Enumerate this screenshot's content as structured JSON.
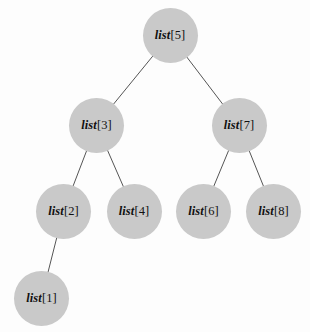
{
  "diagram": {
    "type": "binary-tree",
    "background_color": "#fdfdfd",
    "node_fill_color": "#c9c9c9",
    "edge_color": "#555555",
    "text_color": "#111111",
    "node_radius": 27.5,
    "nodes": [
      {
        "id": "node-5",
        "label": "list[5]",
        "name_part": "list",
        "index_part": "[5]",
        "cx": 170,
        "cy": 35,
        "level": 1,
        "role": "root"
      },
      {
        "id": "node-3",
        "label": "list[3]",
        "name_part": "list",
        "index_part": "[3]",
        "cx": 96.5,
        "cy": 125,
        "level": 2,
        "role": "left-child"
      },
      {
        "id": "node-7",
        "label": "list[7]",
        "name_part": "list",
        "index_part": "[7]",
        "cx": 239,
        "cy": 125.5,
        "level": 2,
        "role": "right-child"
      },
      {
        "id": "node-2",
        "label": "list[2]",
        "name_part": "list",
        "index_part": "[2]",
        "cx": 63.5,
        "cy": 211,
        "level": 3,
        "role": "left-child"
      },
      {
        "id": "node-4",
        "label": "list[4]",
        "name_part": "list",
        "index_part": "[4]",
        "cx": 134,
        "cy": 211,
        "level": 3,
        "role": "right-child"
      },
      {
        "id": "node-6",
        "label": "list[6]",
        "name_part": "list",
        "index_part": "[6]",
        "cx": 203.5,
        "cy": 211,
        "level": 3,
        "role": "left-child"
      },
      {
        "id": "node-8",
        "label": "list[8]",
        "name_part": "list",
        "index_part": "[8]",
        "cx": 273.5,
        "cy": 211,
        "level": 3,
        "role": "right-child"
      },
      {
        "id": "node-1",
        "label": "list[1]",
        "name_part": "list",
        "index_part": "[1]",
        "cx": 41.5,
        "cy": 298,
        "level": 4,
        "role": "left-child"
      }
    ],
    "edges": [
      {
        "id": "edge-5-3",
        "from": "node-5",
        "to": "node-3"
      },
      {
        "id": "edge-5-7",
        "from": "node-5",
        "to": "node-7"
      },
      {
        "id": "edge-3-2",
        "from": "node-3",
        "to": "node-2"
      },
      {
        "id": "edge-3-4",
        "from": "node-3",
        "to": "node-4"
      },
      {
        "id": "edge-7-6",
        "from": "node-7",
        "to": "node-6"
      },
      {
        "id": "edge-7-8",
        "from": "node-7",
        "to": "node-8"
      },
      {
        "id": "edge-2-1",
        "from": "node-2",
        "to": "node-1"
      }
    ]
  }
}
